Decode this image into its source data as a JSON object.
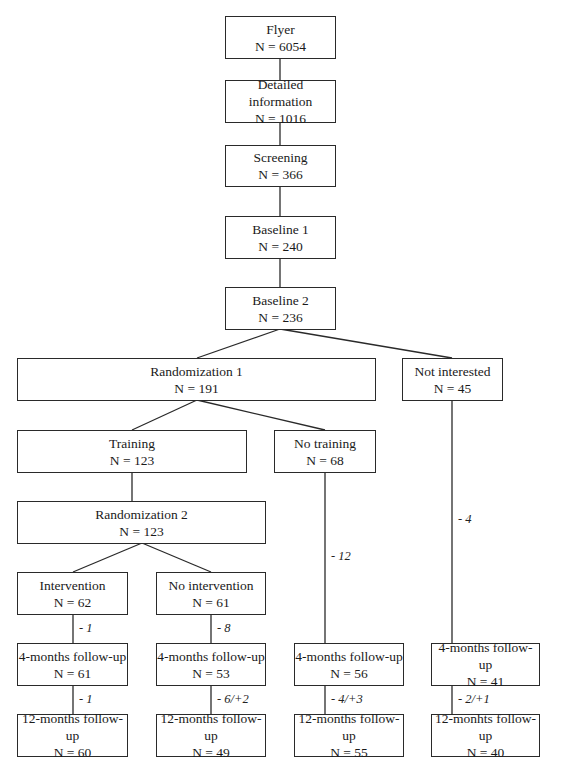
{
  "nodes": {
    "flyer": {
      "title": "Flyer",
      "n": "N = 6054"
    },
    "detailed_information": {
      "title": "Detailed information",
      "n": "N = 1016"
    },
    "screening": {
      "title": "Screening",
      "n": "N = 366"
    },
    "baseline1": {
      "title": "Baseline 1",
      "n": "N = 240"
    },
    "baseline2": {
      "title": "Baseline 2",
      "n": "N = 236"
    },
    "randomization1": {
      "title": "Randomization 1",
      "n": "N = 191"
    },
    "not_interested": {
      "title": "Not interested",
      "n": "N = 45"
    },
    "training": {
      "title": "Training",
      "n": "N = 123"
    },
    "no_training": {
      "title": "No training",
      "n": "N = 68"
    },
    "randomization2": {
      "title": "Randomization 2",
      "n": "N = 123"
    },
    "intervention": {
      "title": "Intervention",
      "n": "N = 62"
    },
    "no_intervention": {
      "title": "No intervention",
      "n": "N = 61"
    },
    "intervention_4m": {
      "title": "4-months follow-up",
      "n": "N = 61"
    },
    "no_intervention_4m": {
      "title": "4-months follow-up",
      "n": "N = 53"
    },
    "no_training_4m": {
      "title": "4-months follow-up",
      "n": "N = 56"
    },
    "not_interested_4m": {
      "title": "4-months follow-up",
      "n": "N = 41"
    },
    "intervention_12m": {
      "title": "12-months follow-up",
      "n": "N = 60"
    },
    "no_intervention_12m": {
      "title": "12-months follow-up",
      "n": "N = 49"
    },
    "no_training_12m": {
      "title": "12-months follow-up",
      "n": "N = 55"
    },
    "not_interested_12m": {
      "title": "12-monhts follow-up",
      "n": "N = 40"
    }
  },
  "edge_labels": {
    "intervention_to_4m": "- 1",
    "no_intervention_to_4m": "- 8",
    "no_training_to_4m": "- 12",
    "not_interested_to_4m": "- 4",
    "intervention_4m_to_12m": "- 1",
    "no_intervention_4m_to_12m": "- 6/+2",
    "no_training_4m_to_12m": "- 4/+3",
    "not_interested_4m_to_12m": "- 2/+1"
  }
}
